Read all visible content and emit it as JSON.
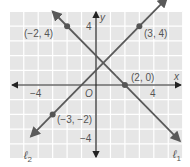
{
  "chart_data": {
    "type": "line",
    "title": "",
    "xlabel": "x",
    "ylabel": "y",
    "xlim": [
      -6,
      6
    ],
    "ylim": [
      -5,
      5
    ],
    "grid": true,
    "x_ticks_labeled": [
      -4,
      4
    ],
    "y_ticks_labeled": [
      4,
      -4
    ],
    "origin_label": "O",
    "series": [
      {
        "name": "ℓ1",
        "label": "ℓ1",
        "slope": -1,
        "intercept": 2,
        "points": [
          {
            "x": -2,
            "y": 4,
            "label": "(−2, 4)"
          },
          {
            "x": 2,
            "y": 0,
            "label": "(2, 0)"
          }
        ]
      },
      {
        "name": "ℓ2",
        "label": "ℓ2",
        "slope": 1,
        "intercept": 1,
        "points": [
          {
            "x": 3,
            "y": 4,
            "label": "(3, 4)"
          },
          {
            "x": -3,
            "y": -2,
            "label": "(−3, −2)"
          }
        ]
      }
    ]
  },
  "labels": {
    "x_axis": "x",
    "y_axis": "y",
    "origin": "O",
    "x_neg4": "−4",
    "x_pos4": "4",
    "y_pos4": "4",
    "y_neg4": "−4",
    "pt_a": "(−2, 4)",
    "pt_b": "(3, 4)",
    "pt_c": "(2, 0)",
    "pt_d": "(−3, −2)",
    "line1_main": "ℓ",
    "line1_sub": "1",
    "line2_main": "ℓ",
    "line2_sub": "2"
  },
  "colors": {
    "grid_bg": "#e6e6e6",
    "grid_line": "#ffffff",
    "axis": "#333333",
    "line": "#5a5a5a",
    "point": "#555555",
    "text": "#555555"
  }
}
